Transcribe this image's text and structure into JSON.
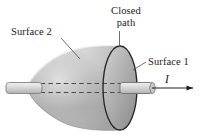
{
  "figure": {
    "labels": {
      "surface_2": "Surface 2",
      "closed_path_line_1": "Closed",
      "closed_path_line_2": "path",
      "surface_1": "Surface 1",
      "current": "I"
    },
    "icon_names": {
      "cone_body": "cone-surface-icon",
      "closed_path_ellipse": "ellipse-closed-path-icon",
      "wire_left": "wire-segment-icon",
      "wire_right": "wire-segment-icon",
      "hidden_wire_dashes": "dashed-hidden-wire-icon",
      "current_arrow": "arrow-right-icon",
      "leader_surface_2": "leader-line-icon",
      "leader_closed_path": "leader-line-icon",
      "leader_surface_1": "leader-line-icon"
    },
    "colors": {
      "background": "#ffffff",
      "text": "#1a1a1a",
      "cone_light": "#dcdcdc",
      "cone_mid": "#b8b8b8",
      "cone_dark": "#9a9a9a",
      "disk_light": "#cacaca",
      "disk_dark": "#8e8e8e",
      "outline": "#2b2b2b",
      "wire_fill": "#d8d8d8",
      "wire_edge": "#7d7d7d",
      "leader": "#555555",
      "dash": "#4a4a4a"
    },
    "geometry_notes": {
      "wire_axis_y": 88,
      "disk_center_x": 120,
      "disk_rx": 17,
      "disk_ry": 42,
      "cone_apex_x": 28,
      "arrow_tip_x": 196
    }
  }
}
